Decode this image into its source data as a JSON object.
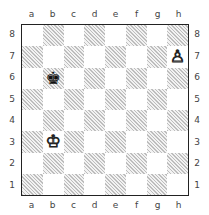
{
  "board": {
    "files": [
      "a",
      "b",
      "c",
      "d",
      "e",
      "f",
      "g",
      "h"
    ],
    "ranks": [
      "8",
      "7",
      "6",
      "5",
      "4",
      "3",
      "2",
      "1"
    ],
    "pieces": [
      {
        "square": "h7",
        "type": "pawn",
        "color": "white",
        "glyph": "♙"
      },
      {
        "square": "b6",
        "type": "king",
        "color": "black",
        "glyph": "♚"
      },
      {
        "square": "b3",
        "type": "king",
        "color": "white",
        "glyph": "♔"
      }
    ]
  }
}
